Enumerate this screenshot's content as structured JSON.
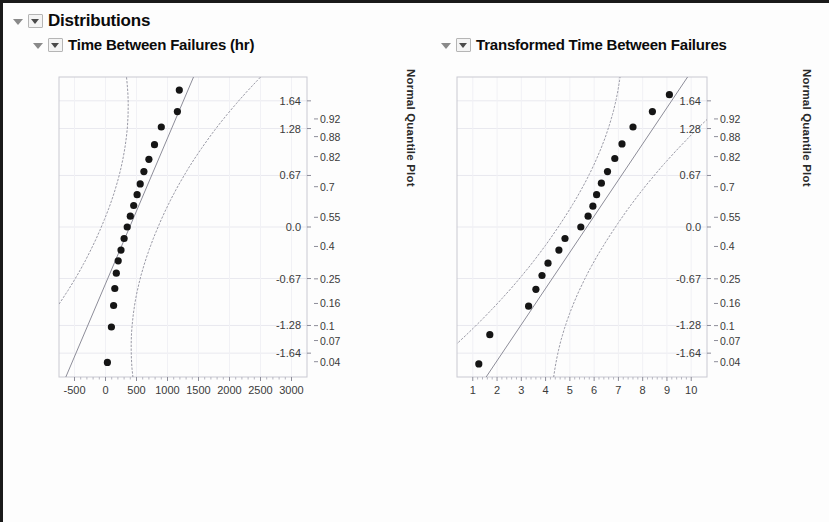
{
  "window": {
    "outline_title": "Distributions",
    "background": "#fdfdfd",
    "border_color": "#1a1a1a"
  },
  "icons": {
    "disclosure_triangle": "triangle-down-icon",
    "disclosure_box": "boxed-triangle-down-icon"
  },
  "panels": [
    {
      "id": "left",
      "title": "Time Between Failures (hr)"
    },
    {
      "id": "right",
      "title": "Transformed Time Between Failures"
    }
  ],
  "chart_data": [
    {
      "type": "scatter",
      "title": "Time Between Failures (hr)",
      "subtitle": "Normal Quantile Plot",
      "xlabel": "",
      "ylabel": "Normal Quantile Plot",
      "xlim": [
        -750,
        3250
      ],
      "ylim": [
        -1.95,
        1.95
      ],
      "grid": true,
      "legend": "none",
      "xticks": [
        -500,
        0,
        500,
        1000,
        1500,
        2000,
        2500,
        3000
      ],
      "xtick_labels": [
        "-500",
        "0",
        "500",
        "1000",
        "1500",
        "2000",
        "2500",
        "3000"
      ],
      "yticks": [
        1.64,
        1.28,
        0.67,
        0.0,
        -0.67,
        -1.28,
        -1.64
      ],
      "ytick_labels": [
        "1.64",
        "1.28",
        "0.67",
        "0.0",
        "-0.67",
        "-1.28",
        "-1.64"
      ],
      "prob_ticks": [
        1.405,
        1.175,
        0.915,
        0.524,
        0.126,
        -0.253,
        -0.674,
        -0.994,
        -1.282,
        -1.476,
        -1.751
      ],
      "prob_tick_labels": [
        "0.92",
        "0.88",
        "0.82",
        "0.7",
        "0.55",
        "0.4",
        "0.25",
        "0.16",
        "0.1",
        "0.07",
        "0.04"
      ],
      "points": [
        {
          "x": 30,
          "y": -1.76
        },
        {
          "x": 95,
          "y": -1.3
        },
        {
          "x": 130,
          "y": -1.02
        },
        {
          "x": 150,
          "y": -0.8
        },
        {
          "x": 175,
          "y": -0.6
        },
        {
          "x": 205,
          "y": -0.44
        },
        {
          "x": 250,
          "y": -0.3
        },
        {
          "x": 300,
          "y": -0.15
        },
        {
          "x": 350,
          "y": 0.0
        },
        {
          "x": 400,
          "y": 0.14
        },
        {
          "x": 455,
          "y": 0.28
        },
        {
          "x": 510,
          "y": 0.42
        },
        {
          "x": 560,
          "y": 0.56
        },
        {
          "x": 620,
          "y": 0.72
        },
        {
          "x": 700,
          "y": 0.88
        },
        {
          "x": 790,
          "y": 1.07
        },
        {
          "x": 900,
          "y": 1.3
        },
        {
          "x": 1160,
          "y": 1.5
        },
        {
          "x": 1190,
          "y": 1.78
        }
      ],
      "reference_line": {
        "x0": -640,
        "y0": -1.95,
        "x1": 1420,
        "y1": 1.95
      },
      "confidence_bands": true,
      "annotations": []
    },
    {
      "type": "scatter",
      "title": "Transformed Time Between Failures",
      "subtitle": "Normal Quantile Plot",
      "xlabel": "",
      "ylabel": "Normal Quantile Plot",
      "xlim": [
        0.35,
        10.65
      ],
      "ylim": [
        -1.95,
        1.95
      ],
      "grid": true,
      "legend": "none",
      "xticks": [
        1,
        2,
        3,
        4,
        5,
        6,
        7,
        8,
        9,
        10
      ],
      "xtick_labels": [
        "1",
        "2",
        "3",
        "4",
        "5",
        "6",
        "7",
        "8",
        "9",
        "10"
      ],
      "yticks": [
        1.64,
        1.28,
        0.67,
        0.0,
        -0.67,
        -1.28,
        -1.64
      ],
      "ytick_labels": [
        "1.64",
        "1.28",
        "0.67",
        "0.0",
        "-0.67",
        "-1.28",
        "-1.64"
      ],
      "prob_ticks": [
        1.405,
        1.175,
        0.915,
        0.524,
        0.126,
        -0.253,
        -0.674,
        -0.994,
        -1.282,
        -1.476,
        -1.751
      ],
      "prob_tick_labels": [
        "0.92",
        "0.88",
        "0.82",
        "0.7",
        "0.55",
        "0.4",
        "0.25",
        "0.16",
        "0.1",
        "0.07",
        "0.04"
      ],
      "points": [
        {
          "x": 1.25,
          "y": -1.78
        },
        {
          "x": 1.7,
          "y": -1.4
        },
        {
          "x": 3.3,
          "y": -1.03
        },
        {
          "x": 3.6,
          "y": -0.81
        },
        {
          "x": 3.85,
          "y": -0.63
        },
        {
          "x": 4.1,
          "y": -0.47
        },
        {
          "x": 4.55,
          "y": -0.3
        },
        {
          "x": 4.8,
          "y": -0.15
        },
        {
          "x": 5.45,
          "y": 0.0
        },
        {
          "x": 5.75,
          "y": 0.14
        },
        {
          "x": 5.95,
          "y": 0.27
        },
        {
          "x": 6.1,
          "y": 0.42
        },
        {
          "x": 6.3,
          "y": 0.57
        },
        {
          "x": 6.55,
          "y": 0.72
        },
        {
          "x": 6.85,
          "y": 0.89
        },
        {
          "x": 7.15,
          "y": 1.08
        },
        {
          "x": 7.6,
          "y": 1.3
        },
        {
          "x": 8.4,
          "y": 1.5
        },
        {
          "x": 9.1,
          "y": 1.72
        }
      ],
      "reference_line": {
        "x0": 1.55,
        "y0": -1.95,
        "x1": 9.85,
        "y1": 1.95
      },
      "confidence_bands": true,
      "annotations": []
    }
  ]
}
